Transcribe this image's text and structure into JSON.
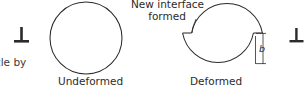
{
  "figure": {
    "title_partial_text": "icle by",
    "background_color": "#ffffff",
    "line_color": "#2b2b2b",
    "width": 308,
    "height": 93
  },
  "labels": {
    "undeformed": "Undeformed",
    "deformed": "Deformed",
    "new_interface": "New interface\nformed",
    "burgers_vector": "b"
  },
  "symbols": {
    "dislocation_left": "dislocation-symbol",
    "dislocation_right": "dislocation-symbol"
  },
  "diagram": {
    "type": "schematic",
    "shapes": [
      {
        "name": "undeformed-particle",
        "kind": "circle",
        "cx": 86,
        "cy": 38,
        "r": 36
      },
      {
        "name": "deformed-particle",
        "kind": "sheared-circle",
        "cx": 222,
        "cy": 38,
        "r": 36,
        "shear_offset": 9,
        "shear_level_y": 33
      }
    ],
    "dimension": {
      "name": "burgers-vector-b",
      "label": "b",
      "x": 257,
      "y_top": 33,
      "y_bottom": 64
    }
  }
}
